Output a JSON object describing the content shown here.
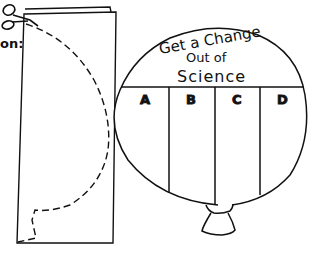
{
  "illustration": {
    "left_panel": {
      "partial_label": "on:",
      "description": "Folded sheet of paper with dashed half-balloon cut line",
      "icons": [
        "scissors-icon"
      ]
    },
    "balloon": {
      "title_line1": "Get a Change",
      "title_line2": "Out of",
      "title_line3": "Science",
      "columns": [
        "A",
        "B",
        "C",
        "D"
      ]
    },
    "colors": {
      "line": "#111111",
      "background": "#ffffff"
    }
  }
}
